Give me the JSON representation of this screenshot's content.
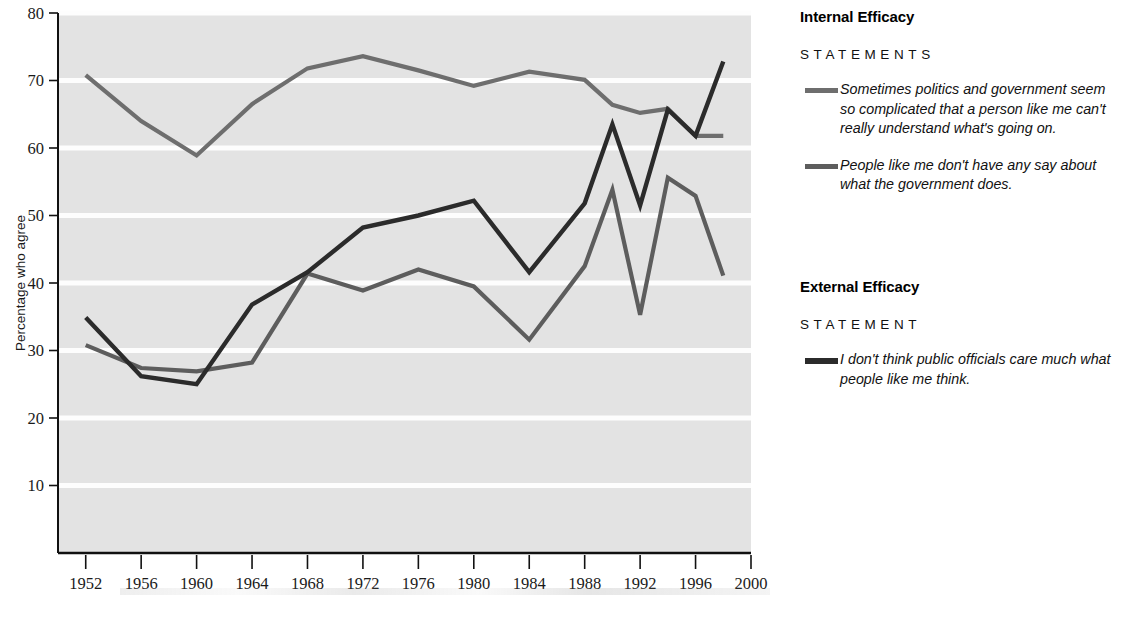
{
  "chart_data": {
    "type": "line",
    "title": "",
    "xlabel": "",
    "ylabel": "Percentage who agree",
    "xlim": [
      1950,
      2000
    ],
    "ylim": [
      0,
      80
    ],
    "grid": true,
    "legend_position": "right",
    "x": [
      1952,
      1956,
      1960,
      1964,
      1968,
      1972,
      1976,
      1980,
      1984,
      1988,
      1990,
      1992,
      1994,
      1996,
      1998
    ],
    "xticks": [
      "1952",
      "1956",
      "1960",
      "1964",
      "1968",
      "1972",
      "1976",
      "1980",
      "1984",
      "1988",
      "1992",
      "1996",
      "2000"
    ],
    "xtick_values": [
      1952,
      1956,
      1960,
      1964,
      1968,
      1972,
      1976,
      1980,
      1984,
      1988,
      1992,
      1996,
      2000
    ],
    "yticks": [
      "10",
      "20",
      "30",
      "40",
      "50",
      "60",
      "70",
      "80"
    ],
    "ytick_values": [
      10,
      20,
      30,
      40,
      50,
      60,
      70,
      80
    ],
    "series": [
      {
        "name": "Sometimes politics and government seem so complicated that a person like me can't really understand what's going on.",
        "short_name": "complicated-politics",
        "color": "#6e6e6e",
        "width": 4.2,
        "values": [
          70.8,
          64.0,
          58.9,
          66.5,
          71.8,
          73.6,
          71.5,
          69.2,
          71.3,
          70.1,
          66.4,
          65.2,
          65.8,
          61.8,
          61.8
        ]
      },
      {
        "name": "People like me don't have any say about what the government does.",
        "short_name": "no-say-government",
        "color": "#5d5d5d",
        "width": 4.2,
        "values": [
          30.8,
          27.4,
          26.9,
          28.2,
          41.4,
          38.9,
          42.0,
          39.5,
          31.6,
          42.5,
          53.8,
          35.3,
          55.6,
          52.9,
          41.1
        ]
      },
      {
        "name": "I don't think public officials care much what people like me think.",
        "short_name": "officials-dont-care",
        "color": "#2b2b2b",
        "width": 4.4,
        "values": [
          34.9,
          26.2,
          25.0,
          36.8,
          41.6,
          48.2,
          50.0,
          52.2,
          41.6,
          51.8,
          63.5,
          51.5,
          65.7,
          61.8,
          72.8
        ]
      }
    ]
  },
  "axis": {
    "ylabel": "Percentage who agree"
  },
  "legend": {
    "groups": [
      {
        "title": "Internal Efficacy",
        "subtitle": "STATEMENTS",
        "entries": [
          {
            "swatch": "#6e6e6e",
            "text": "Sometimes politics and government seem so complicated that a person like me can't really understand what's going on."
          },
          {
            "swatch": "#5d5d5d",
            "text": "People like me don't have any say about what the government does."
          }
        ]
      },
      {
        "title": "External Efficacy",
        "subtitle": "STATEMENT",
        "entries": [
          {
            "swatch": "#2b2b2b",
            "text": "I don't think public officials care much what people like me think."
          }
        ]
      }
    ]
  }
}
